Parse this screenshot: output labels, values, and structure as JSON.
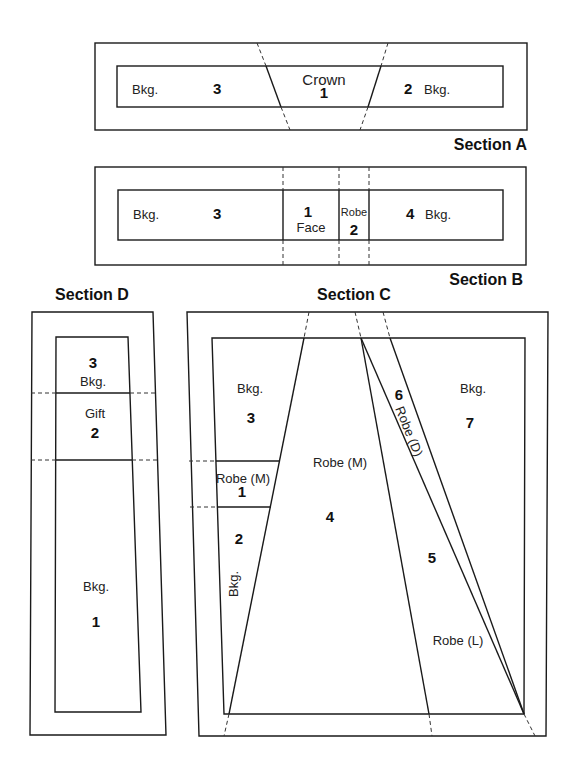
{
  "sections": {
    "A": {
      "title": "Section A",
      "pieces": [
        {
          "number": "3",
          "label": "Bkg."
        },
        {
          "number": "1",
          "label": "Crown"
        },
        {
          "number": "2",
          "label": "Bkg."
        }
      ]
    },
    "B": {
      "title": "Section B",
      "pieces": [
        {
          "number": "3",
          "label": "Bkg."
        },
        {
          "number": "1",
          "label": "Face"
        },
        {
          "number": "2",
          "label": "Robe"
        },
        {
          "number": "4",
          "label": "Bkg."
        }
      ]
    },
    "C": {
      "title": "Section C",
      "pieces": [
        {
          "number": "1",
          "label": "Robe (M)"
        },
        {
          "number": "2",
          "label": "Bkg."
        },
        {
          "number": "3",
          "label": "Bkg."
        },
        {
          "number": "4",
          "label": "Robe (M)"
        },
        {
          "number": "5",
          "label": "Robe (L)"
        },
        {
          "number": "6",
          "label": "Robe (D)"
        },
        {
          "number": "7",
          "label": "Bkg."
        }
      ]
    },
    "D": {
      "title": "Section D",
      "pieces": [
        {
          "number": "1",
          "label": "Bkg."
        },
        {
          "number": "2",
          "label": "Gift"
        },
        {
          "number": "3",
          "label": "Bkg."
        }
      ]
    }
  }
}
